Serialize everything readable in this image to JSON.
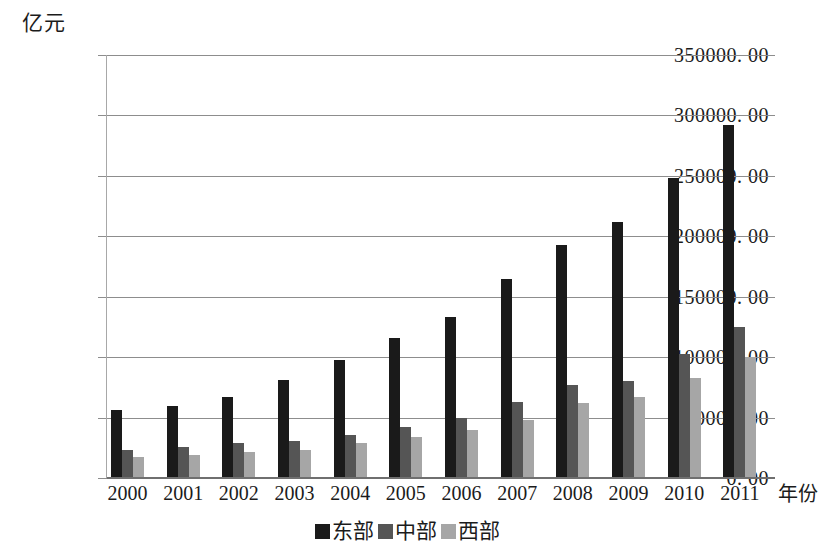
{
  "chart_data": {
    "type": "bar",
    "title": "",
    "subtitle": "",
    "xlabel": "年份",
    "ylabel": "亿元",
    "ylim": [
      0,
      350000
    ],
    "ytick_step": 50000,
    "grid": true,
    "legend_position": "bottom-center",
    "categories": [
      "2000",
      "2001",
      "2002",
      "2003",
      "2004",
      "2005",
      "2006",
      "2007",
      "2008",
      "2009",
      "2010",
      "2011"
    ],
    "ytick_labels": [
      "350000. 00",
      "300000. 00",
      "250000. 00",
      "200000. 00",
      "150000. 00",
      "100000. 00",
      "50000. 00",
      "0. 00"
    ],
    "ytick_values": [
      350000,
      300000,
      250000,
      200000,
      150000,
      100000,
      50000,
      0
    ],
    "series": [
      {
        "name": "东部",
        "color": "#1a1a1a",
        "values": [
          56000,
          60000,
          67000,
          81000,
          97500,
          116000,
          133000,
          165000,
          193000,
          212000,
          248000,
          292000
        ]
      },
      {
        "name": "中部",
        "color": "#555555",
        "values": [
          23000,
          26000,
          29000,
          31000,
          36000,
          42000,
          50000,
          63000,
          77000,
          80000,
          103000,
          125000
        ]
      },
      {
        "name": "西部",
        "color": "#a6a6a6",
        "values": [
          17500,
          19000,
          21500,
          23000,
          29000,
          34000,
          40000,
          48000,
          62000,
          67000,
          82500,
          100000
        ]
      }
    ]
  },
  "legend": {
    "items": [
      {
        "label": "东部",
        "color": "#1a1a1a"
      },
      {
        "label": "中部",
        "color": "#555555"
      },
      {
        "label": "西部",
        "color": "#a6a6a6"
      }
    ]
  }
}
